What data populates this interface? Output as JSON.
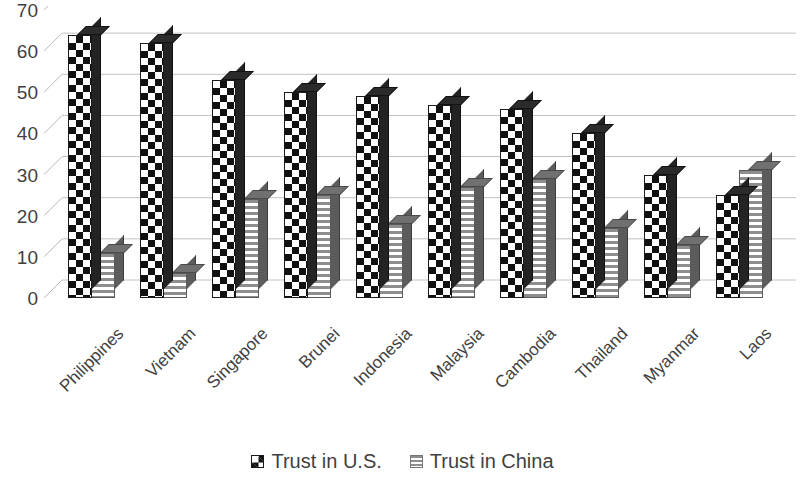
{
  "chart_data": {
    "type": "bar",
    "title": "",
    "subtitle": "",
    "xlabel": "",
    "ylabel": "",
    "grid": true,
    "legend_position": "bottom",
    "style": "3d-clustered-column",
    "ylim": [
      0,
      70
    ],
    "ytick_step": 10,
    "ytick_labels": [
      "70",
      "60",
      "50",
      "40",
      "30",
      "20",
      "10",
      "0"
    ],
    "ytick_values": [
      70,
      60,
      50,
      40,
      30,
      20,
      10,
      0
    ],
    "categories": [
      "Philippines",
      "Vietnam",
      "Singapore",
      "Brunei",
      "Indonesia",
      "Malaysia",
      "Cambodia",
      "Thailand",
      "Myanmar",
      "Laos"
    ],
    "series": [
      {
        "name": "Trust in U.S.",
        "pattern": "checkerboard",
        "color": "#1a1a1a",
        "values": [
          64,
          62,
          53,
          50,
          49,
          47,
          46,
          40,
          30,
          25
        ]
      },
      {
        "name": "Trust in China",
        "pattern": "horizontal-stripes",
        "color": "#8e8e8e",
        "values": [
          11,
          6,
          24,
          25,
          18,
          27,
          29,
          17,
          13,
          31
        ]
      }
    ]
  },
  "legend": {
    "items": [
      {
        "label": "Trust in U.S.",
        "swatch": "checkerboard-swatch-icon"
      },
      {
        "label": "Trust in China",
        "swatch": "striped-swatch-icon"
      }
    ]
  }
}
